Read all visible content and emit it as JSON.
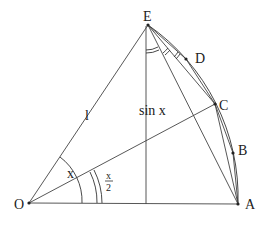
{
  "diagram": {
    "type": "geometry",
    "points": {
      "O": {
        "label": "O",
        "x": 29,
        "y": 203
      },
      "A": {
        "label": "A",
        "x": 238,
        "y": 204
      },
      "B": {
        "label": "B",
        "x": 233,
        "y": 153
      },
      "C": {
        "label": "C",
        "x": 215,
        "y": 104
      },
      "D": {
        "label": "D",
        "x": 186,
        "y": 59
      },
      "E": {
        "label": "E",
        "x": 148,
        "y": 25
      }
    },
    "labels": {
      "radius": "l",
      "sine": "sin x",
      "angle_x": "x",
      "angle_half_num": "x",
      "angle_half_den": "2"
    }
  }
}
